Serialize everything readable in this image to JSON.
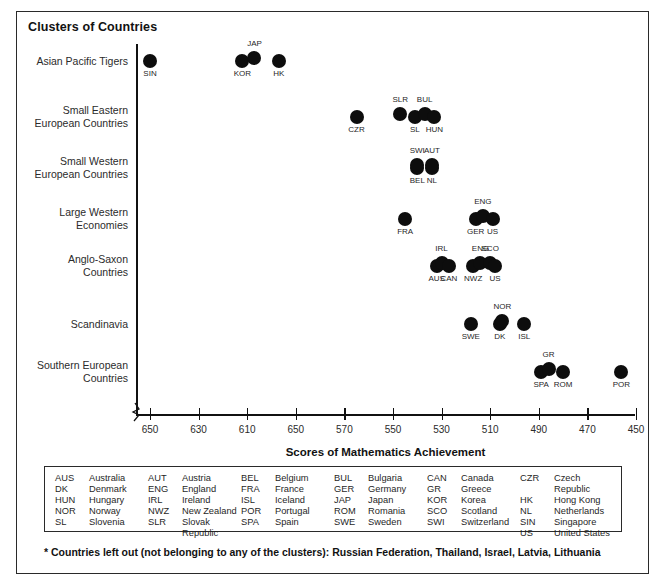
{
  "chart_title": "Clusters of Countries",
  "footnote": "* Countries left out (not belonging to any of the clusters): Russian Federation, Thailand, Israel, Latvia, Lithuania",
  "chart_data": {
    "type": "scatter",
    "title": "Clusters of Countries",
    "xlabel": "Scores of Mathematics Achievement",
    "ylabel": "",
    "grid": false,
    "legend_position": "bottom-box",
    "x_axis_reversed": true,
    "x_ticks": [
      "650",
      "630",
      "610",
      "650",
      "570",
      "550",
      "530",
      "510",
      "490",
      "470",
      "450"
    ],
    "x_tick_note": "The fourth tick label is printed as 650 in the source image (apparent typo for 590).",
    "xlim": [
      650,
      450
    ],
    "categories": [
      "Asian Pacific Tigers",
      "Small Eastern\nEuropean Countries",
      "Small Western\nEuropean Countries",
      "Large Western\nEconomies",
      "Anglo-Saxon\nCountries",
      "Scandinavia",
      "Southern European\nCountries"
    ],
    "series": [
      {
        "name": "Asian Pacific Tigers",
        "row": 0,
        "points": [
          {
            "code": "SIN",
            "score": 650,
            "label_pos": "below"
          },
          {
            "code": "KOR",
            "score": 612,
            "label_pos": "below"
          },
          {
            "code": "JAP",
            "score": 607,
            "label_pos": "above"
          },
          {
            "code": "HK",
            "score": 597,
            "label_pos": "below"
          }
        ]
      },
      {
        "name": "Small Eastern European Countries",
        "row": 1,
        "points": [
          {
            "code": "CZR",
            "score": 565,
            "label_pos": "below"
          },
          {
            "code": "SLR",
            "score": 547,
            "label_pos": "above"
          },
          {
            "code": "SL",
            "score": 541,
            "label_pos": "below"
          },
          {
            "code": "BUL",
            "score": 537,
            "label_pos": "above"
          },
          {
            "code": "HUN",
            "score": 533,
            "label_pos": "below"
          }
        ]
      },
      {
        "name": "Small Western European Countries",
        "row": 2,
        "points": [
          {
            "code": "BEL",
            "score": 540,
            "label_pos": "below"
          },
          {
            "code": "SWI",
            "score": 540,
            "label_pos": "above"
          },
          {
            "code": "NL",
            "score": 534,
            "label_pos": "below"
          },
          {
            "code": "AUT",
            "score": 534,
            "label_pos": "above"
          }
        ]
      },
      {
        "name": "Large Western Economies",
        "row": 3,
        "points": [
          {
            "code": "FRA",
            "score": 545,
            "label_pos": "below"
          },
          {
            "code": "GER",
            "score": 516,
            "label_pos": "below"
          },
          {
            "code": "ENG",
            "score": 513,
            "label_pos": "above"
          },
          {
            "code": "US",
            "score": 509,
            "label_pos": "below"
          }
        ]
      },
      {
        "name": "Anglo-Saxon Countries",
        "row": 4,
        "points": [
          {
            "code": "AUS",
            "score": 532,
            "label_pos": "below"
          },
          {
            "code": "IRL",
            "score": 530,
            "label_pos": "above"
          },
          {
            "code": "CAN",
            "score": 527,
            "label_pos": "below"
          },
          {
            "code": "NWZ",
            "score": 517,
            "label_pos": "below"
          },
          {
            "code": "ENG",
            "score": 514,
            "label_pos": "above"
          },
          {
            "code": "SCO",
            "score": 510,
            "label_pos": "above"
          },
          {
            "code": "US",
            "score": 508,
            "label_pos": "below"
          }
        ]
      },
      {
        "name": "Scandinavia",
        "row": 5,
        "points": [
          {
            "code": "SWE",
            "score": 518,
            "label_pos": "below"
          },
          {
            "code": "DK",
            "score": 506,
            "label_pos": "below"
          },
          {
            "code": "NOR",
            "score": 505,
            "label_pos": "above"
          },
          {
            "code": "ISL",
            "score": 496,
            "label_pos": "below"
          }
        ]
      },
      {
        "name": "Southern European Countries",
        "row": 6,
        "points": [
          {
            "code": "SPA",
            "score": 489,
            "label_pos": "below"
          },
          {
            "code": "GR",
            "score": 486,
            "label_pos": "above"
          },
          {
            "code": "ROM",
            "score": 480,
            "label_pos": "below"
          },
          {
            "code": "POR",
            "score": 456,
            "label_pos": "below"
          }
        ]
      }
    ]
  },
  "legend": {
    "columns": [
      [
        {
          "code": "AUS",
          "name": "Australia"
        },
        {
          "code": "DK",
          "name": "Denmark"
        },
        {
          "code": "HUN",
          "name": "Hungary"
        },
        {
          "code": "NOR",
          "name": "Norway"
        },
        {
          "code": "SL",
          "name": "Slovenia"
        }
      ],
      [
        {
          "code": "AUT",
          "name": "Austria"
        },
        {
          "code": "ENG",
          "name": "England"
        },
        {
          "code": "IRL",
          "name": "Ireland"
        },
        {
          "code": "NWZ",
          "name": "New Zealand"
        },
        {
          "code": "SLR",
          "name": "Slovak Republic"
        }
      ],
      [
        {
          "code": "BEL",
          "name": "Belgium"
        },
        {
          "code": "FRA",
          "name": "France"
        },
        {
          "code": "ISL",
          "name": "Iceland"
        },
        {
          "code": "POR",
          "name": "Portugal"
        },
        {
          "code": "SPA",
          "name": "Spain"
        }
      ],
      [
        {
          "code": "BUL",
          "name": "Bulgaria"
        },
        {
          "code": "GER",
          "name": "Germany"
        },
        {
          "code": "JAP",
          "name": "Japan"
        },
        {
          "code": "ROM",
          "name": "Romania"
        },
        {
          "code": "SWE",
          "name": "Sweden"
        }
      ],
      [
        {
          "code": "CAN",
          "name": "Canada"
        },
        {
          "code": "GR",
          "name": "Greece"
        },
        {
          "code": "KOR",
          "name": "Korea"
        },
        {
          "code": "SCO",
          "name": "Scotland"
        },
        {
          "code": "SWI",
          "name": "Switzerland"
        }
      ],
      [
        {
          "code": "CZR",
          "name": "Czech Republic"
        },
        {
          "code": "HK",
          "name": "Hong Kong"
        },
        {
          "code": "NL",
          "name": "Netherlands"
        },
        {
          "code": "SIN",
          "name": "Singapore"
        },
        {
          "code": "US",
          "name": "United States"
        }
      ]
    ]
  }
}
